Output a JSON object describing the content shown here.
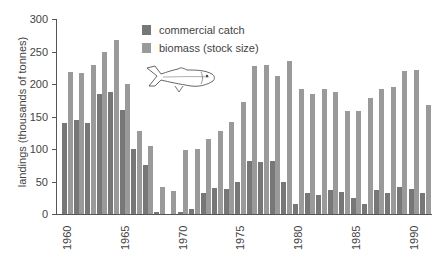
{
  "chart_data": {
    "type": "bar",
    "title": "",
    "xlabel": "",
    "ylabel": "landings (thousands of tonnes)",
    "ylim": [
      0,
      300
    ],
    "yticks": [
      0,
      50,
      100,
      150,
      200,
      250,
      300
    ],
    "xtick_labels": [
      "1960",
      "1965",
      "1970",
      "1975",
      "1980",
      "1985",
      "1990"
    ],
    "grid": false,
    "legend_position": "top-center",
    "categories": [
      "1960",
      "1961",
      "1962",
      "1963",
      "1964",
      "1965",
      "1966",
      "1967",
      "1968",
      "1969",
      "1970",
      "1971",
      "1972",
      "1973",
      "1974",
      "1975",
      "1976",
      "1977",
      "1978",
      "1979",
      "1980",
      "1981",
      "1982",
      "1983",
      "1984",
      "1985",
      "1986",
      "1987",
      "1988",
      "1989",
      "1990",
      "1991"
    ],
    "series": [
      {
        "name": "commercial catch",
        "color": "#777777",
        "values": [
          140,
          145,
          140,
          185,
          188,
          160,
          100,
          75,
          3,
          0,
          3,
          8,
          32,
          40,
          38,
          50,
          82,
          80,
          82,
          50,
          15,
          32,
          30,
          37,
          34,
          25,
          15,
          37,
          32,
          42,
          38,
          33
        ]
      },
      {
        "name": "biomass (stock size)",
        "color": "#9a9a9a",
        "values": [
          218,
          217,
          230,
          250,
          268,
          200,
          128,
          105,
          42,
          35,
          98,
          100,
          115,
          127,
          142,
          172,
          228,
          230,
          212,
          235,
          193,
          185,
          193,
          187,
          158,
          158,
          178,
          193,
          195,
          220,
          222,
          168
        ]
      }
    ],
    "annotations": [
      "fish illustration (herring)"
    ]
  },
  "legend": {
    "items": [
      {
        "label": "commercial catch",
        "color": "#777777"
      },
      {
        "label": "biomass (stock size)",
        "color": "#9a9a9a"
      }
    ]
  },
  "axis": {
    "ylabel": "landings (thousands of tonnes)",
    "yticks": [
      "0",
      "50",
      "100",
      "150",
      "200",
      "250",
      "300"
    ],
    "xticks": [
      "1960",
      "1965",
      "1970",
      "1975",
      "1980",
      "1985",
      "1990"
    ]
  }
}
